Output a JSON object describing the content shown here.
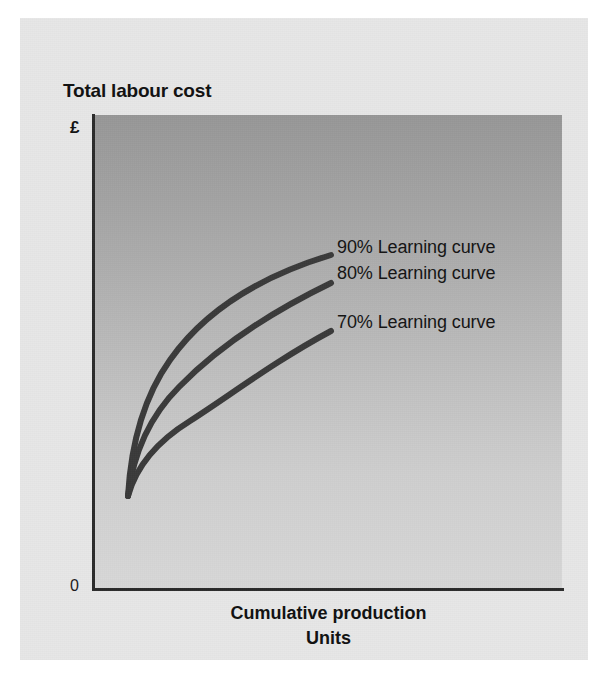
{
  "chart_data": {
    "type": "line",
    "title": "Total labour cost",
    "ylabel": "Total labour cost",
    "yunit": "£",
    "y_tick_labels": [
      "0"
    ],
    "xlabel_line1": "Cumulative production",
    "xlabel_line2": "Units",
    "grid": false,
    "legend_position": "inline-right-of-curve-ends",
    "axis_color": "#2b2b2b",
    "curve_color": "#3a3a3a",
    "plot_bg_top": "#979797",
    "plot_bg_bottom": "#d8d8d8",
    "card_bg": "#e7e7e7",
    "page_bg": "#ffffff",
    "series": [
      {
        "name": "90% Learning curve",
        "rate_percent": 90,
        "label": "90% Learning curve",
        "color": "#3a3a3a",
        "path": "M 33 381 C 36 330, 48 283, 75 245 C 108 198, 160 163, 236 140",
        "end_point": {
          "x": 236,
          "y": 140
        }
      },
      {
        "name": "80% Learning curve",
        "rate_percent": 80,
        "label": "80% Learning curve",
        "color": "#3a3a3a",
        "path": "M 33 381 C 38 341, 54 302, 84 272 C 122 233, 170 200, 236 168",
        "end_point": {
          "x": 236,
          "y": 168
        }
      },
      {
        "name": "70% Learning curve",
        "rate_percent": 70,
        "label": "70% Learning curve",
        "color": "#3a3a3a",
        "path": "M 33 381 C 41 352, 61 327, 95 306 C 137 279, 180 246, 236 216",
        "end_point": {
          "x": 236,
          "y": 216
        }
      }
    ],
    "origin_point": {
      "x": 33,
      "y": 381
    }
  },
  "chart": {
    "title": "Total labour cost",
    "y_unit": "£",
    "y_zero": "0",
    "x_title_line1": "Cumulative production",
    "x_title_line2": "Units",
    "labels": {
      "curve90": "90% Learning curve",
      "curve80": "80% Learning curve",
      "curve70": "70% Learning curve"
    }
  }
}
